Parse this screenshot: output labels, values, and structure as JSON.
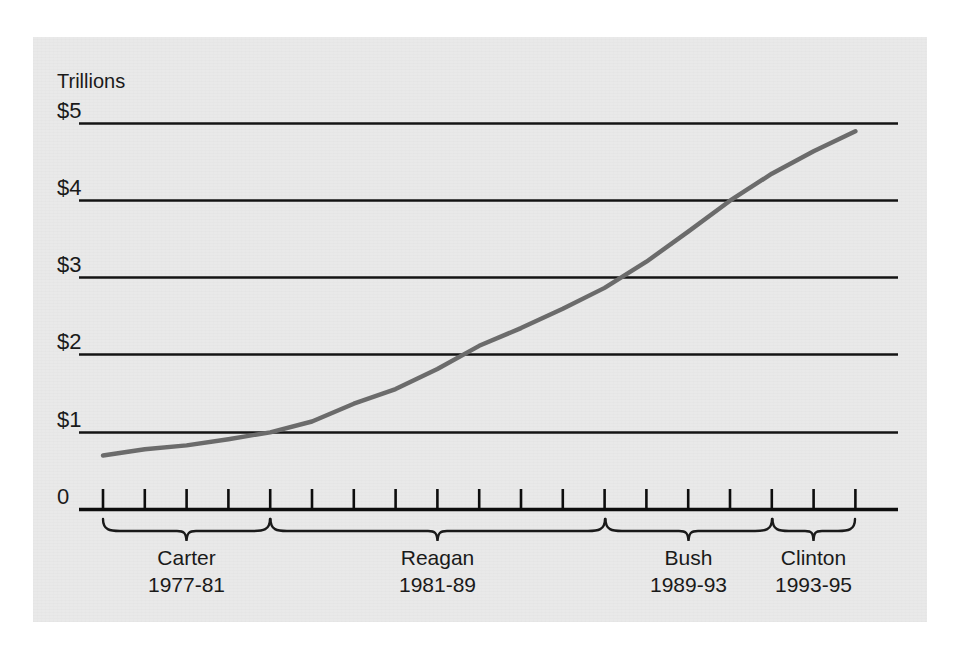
{
  "figure": {
    "unit_label": "Trillions",
    "background_color": "#e9e9e9",
    "line_color": "#6b6b6b",
    "axis_color": "#111111"
  },
  "chart_data": {
    "type": "line",
    "title": "",
    "subtitle": "",
    "xlabel": "",
    "ylabel": "Trillions",
    "ylim": [
      0,
      5
    ],
    "y_ticks": [
      "0",
      "$1",
      "$2",
      "$3",
      "$4",
      "$5"
    ],
    "y_tick_values": [
      0,
      1,
      2,
      3,
      4,
      5
    ],
    "grid": "horizontal",
    "legend": "none",
    "x_axis": {
      "start_year": 1977,
      "end_year": 1995,
      "tick_count": 19,
      "tick_label": ""
    },
    "series": [
      {
        "name": "Gross federal debt",
        "x": [
          1977,
          1978,
          1979,
          1980,
          1981,
          1982,
          1983,
          1984,
          1985,
          1986,
          1987,
          1988,
          1989,
          1990,
          1991,
          1992,
          1993,
          1994,
          1995
        ],
        "values": [
          0.7,
          0.78,
          0.83,
          0.91,
          1.0,
          1.14,
          1.37,
          1.56,
          1.82,
          2.12,
          2.35,
          2.6,
          2.87,
          3.21,
          3.6,
          4.0,
          4.35,
          4.64,
          4.9
        ]
      }
    ],
    "annotations": [
      {
        "name": "Carter",
        "years": "1977-81",
        "start_year": 1977,
        "end_year": 1981
      },
      {
        "name": "Reagan",
        "years": "1981-89",
        "start_year": 1981,
        "end_year": 1989
      },
      {
        "name": "Bush",
        "years": "1989-93",
        "start_year": 1989,
        "end_year": 1993
      },
      {
        "name": "Clinton",
        "years": "1993-95",
        "start_year": 1993,
        "end_year": 1995
      }
    ]
  },
  "eras": [
    {
      "name": "Carter",
      "years": "1977-81"
    },
    {
      "name": "Reagan",
      "years": "1981-89"
    },
    {
      "name": "Bush",
      "years": "1989-93"
    },
    {
      "name": "Clinton",
      "years": "1993-95"
    }
  ],
  "y_labels": [
    {
      "text": "$5"
    },
    {
      "text": "$4"
    },
    {
      "text": "$3"
    },
    {
      "text": "$2"
    },
    {
      "text": "$1"
    },
    {
      "text": "0"
    }
  ]
}
